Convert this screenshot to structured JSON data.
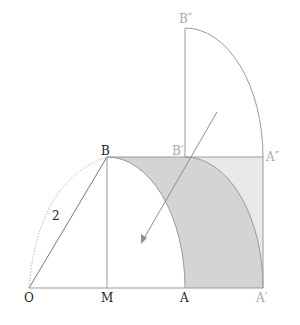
{
  "diagram": {
    "colors": {
      "line": "#9a9a9a",
      "dark_fill": "#d4d4d4",
      "light_fill": "#e9e9e9",
      "label_dark": "#222222",
      "label_light": "#a8a8a8",
      "arrow": "#8f8f8f"
    },
    "points": {
      "O": {
        "label": "O",
        "x": 29,
        "y": 288
      },
      "M": {
        "label": "M",
        "x": 107,
        "y": 288
      },
      "A": {
        "label": "A",
        "x": 185,
        "y": 288
      },
      "A_prime": {
        "label": "A′",
        "x": 263,
        "y": 288
      },
      "B": {
        "label": "B",
        "x": 107,
        "y": 157
      },
      "B_prime": {
        "label": "B′",
        "x": 185,
        "y": 157
      },
      "A_dprime": {
        "label": "A″",
        "x": 263,
        "y": 157
      },
      "B_dprime": {
        "label": "B″",
        "x": 185,
        "y": 28
      }
    },
    "segment_label": {
      "text": "2",
      "x": 55,
      "y": 219
    }
  }
}
